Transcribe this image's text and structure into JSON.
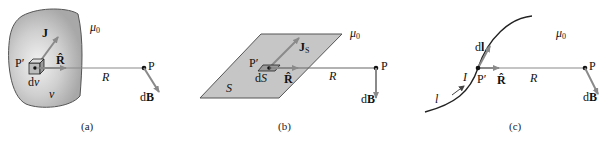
{
  "colors": {
    "region_fill": "#bdbdbd",
    "region_fill_light": "#e6e6e6",
    "vector": "#8a8a8a",
    "line": "#333333",
    "text": "#111111"
  },
  "panels": [
    {
      "id": "a",
      "caption": "(a)",
      "medium": "μ0",
      "source_label": "J",
      "source_point": "P′",
      "element": "dv",
      "region": "v",
      "unit_vector": "R̂",
      "distance": "R",
      "field_point": "P",
      "field_vector": "dB"
    },
    {
      "id": "b",
      "caption": "(b)",
      "medium": "μ0",
      "source_label": "JS",
      "source_point": "P′",
      "element": "dS",
      "region": "S",
      "unit_vector": "R̂",
      "distance": "R",
      "field_point": "P",
      "field_vector": "dB"
    },
    {
      "id": "c",
      "caption": "(c)",
      "medium": "μ0",
      "source_label": "dl",
      "current": "I",
      "source_point": "P′",
      "curve": "l",
      "unit_vector": "R̂",
      "distance": "R",
      "field_point": "P",
      "field_vector": "dB"
    }
  ]
}
